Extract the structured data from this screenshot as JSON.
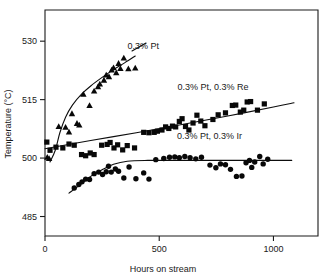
{
  "chart_data": {
    "type": "scatter",
    "title": "",
    "xlabel": "Hours on stream",
    "ylabel": "Temperature (°C)",
    "xlim": [
      0,
      1195
    ],
    "ylim": [
      480,
      538
    ],
    "grid": false,
    "legend_position": "inline-annotations",
    "xticks": [
      0,
      500,
      1000
    ],
    "xticklabels": [
      "0",
      "500",
      "1000"
    ],
    "yticks": [
      485,
      500,
      515,
      530
    ],
    "yticklabels": [
      "485",
      "500",
      "515",
      "530"
    ],
    "series": [
      {
        "name": "0.3% Pt",
        "marker": "triangle",
        "label": "0.3% Pt",
        "label_x": 430,
        "label_y": 528,
        "points": [
          [
            10,
            500.3
          ],
          [
            18,
            500.0
          ],
          [
            60,
            508.2
          ],
          [
            90,
            508.0
          ],
          [
            105,
            506.8
          ],
          [
            118,
            511.5
          ],
          [
            140,
            509.0
          ],
          [
            150,
            508.6
          ],
          [
            168,
            516.5
          ],
          [
            195,
            513.6
          ],
          [
            215,
            517.3
          ],
          [
            232,
            518.4
          ],
          [
            240,
            519.1
          ],
          [
            258,
            520.1
          ],
          [
            268,
            521.4
          ],
          [
            280,
            521.0
          ],
          [
            292,
            522.7
          ],
          [
            300,
            523.3
          ],
          [
            312,
            522.0
          ],
          [
            322,
            524.4
          ],
          [
            330,
            523.1
          ],
          [
            345,
            525.8
          ],
          [
            365,
            523.0
          ],
          [
            395,
            523.2
          ]
        ],
        "fit_curve": [
          [
            22,
            499.0
          ],
          [
            45,
            502.0
          ],
          [
            65,
            506.5
          ],
          [
            90,
            510.5
          ],
          [
            120,
            513.6
          ],
          [
            160,
            516.4
          ],
          [
            200,
            518.5
          ],
          [
            250,
            520.7
          ],
          [
            300,
            522.7
          ],
          [
            350,
            524.5
          ],
          [
            395,
            526.2
          ]
        ]
      },
      {
        "name": "0.3% Pt, 0.3% Re",
        "marker": "square",
        "label": "0.3% Pt, 0.3% Re",
        "label_x": 735,
        "label_y": 517.5,
        "points": [
          [
            8,
            504.1
          ],
          [
            22,
            502.0
          ],
          [
            48,
            502.8
          ],
          [
            78,
            502.6
          ],
          [
            105,
            503.6
          ],
          [
            128,
            503.3
          ],
          [
            160,
            500.9
          ],
          [
            178,
            500.6
          ],
          [
            198,
            501.3
          ],
          [
            215,
            500.9
          ],
          [
            248,
            503.3
          ],
          [
            272,
            503.5
          ],
          [
            285,
            504.0
          ],
          [
            302,
            502.6
          ],
          [
            318,
            503.4
          ],
          [
            340,
            502.1
          ],
          [
            360,
            503.2
          ],
          [
            392,
            502.6
          ],
          [
            432,
            506.6
          ],
          [
            455,
            506.5
          ],
          [
            478,
            506.6
          ],
          [
            492,
            506.9
          ],
          [
            512,
            507.2
          ],
          [
            528,
            508.0
          ],
          [
            542,
            507.6
          ],
          [
            558,
            508.2
          ],
          [
            572,
            508.0
          ],
          [
            588,
            509.4
          ],
          [
            600,
            510.1
          ],
          [
            615,
            508.1
          ],
          [
            630,
            507.2
          ],
          [
            648,
            509.0
          ],
          [
            665,
            511.0
          ],
          [
            682,
            509.5
          ],
          [
            700,
            508.3
          ],
          [
            735,
            509.9
          ],
          [
            758,
            511.1
          ],
          [
            790,
            511.6
          ],
          [
            820,
            513.5
          ],
          [
            835,
            513.6
          ],
          [
            855,
            511.8
          ],
          [
            870,
            512.3
          ],
          [
            885,
            514.4
          ],
          [
            900,
            514.5
          ],
          [
            930,
            512.3
          ],
          [
            960,
            513.9
          ]
        ],
        "fit_curve": [
          [
            0,
            502.4
          ],
          [
            200,
            504.5
          ],
          [
            400,
            506.5
          ],
          [
            600,
            508.6
          ],
          [
            800,
            510.8
          ],
          [
            1000,
            513.1
          ],
          [
            1090,
            514.2
          ]
        ]
      },
      {
        "name": "0.3% Pt, 0.3% Ir",
        "marker": "circle",
        "label": "0.3% Pt, 0.3% Ir",
        "label_x": 720,
        "label_y": 505.0,
        "points": [
          [
            128,
            492.3
          ],
          [
            148,
            493.2
          ],
          [
            162,
            493.9
          ],
          [
            178,
            494.6
          ],
          [
            195,
            494.5
          ],
          [
            215,
            496.0
          ],
          [
            235,
            496.4
          ],
          [
            252,
            495.8
          ],
          [
            268,
            496.5
          ],
          [
            278,
            497.9
          ],
          [
            290,
            496.4
          ],
          [
            308,
            497.2
          ],
          [
            322,
            496.6
          ],
          [
            345,
            494.9
          ],
          [
            368,
            497.7
          ],
          [
            398,
            494.7
          ],
          [
            432,
            496.2
          ],
          [
            455,
            494.6
          ],
          [
            485,
            499.6
          ],
          [
            520,
            499.9
          ],
          [
            545,
            500.2
          ],
          [
            568,
            500.3
          ],
          [
            588,
            500.1
          ],
          [
            612,
            500.4
          ],
          [
            635,
            500.1
          ],
          [
            660,
            499.8
          ],
          [
            685,
            500.2
          ],
          [
            722,
            498.2
          ],
          [
            748,
            497.5
          ],
          [
            768,
            498.5
          ],
          [
            790,
            498.3
          ],
          [
            812,
            497.1
          ],
          [
            838,
            495.3
          ],
          [
            862,
            495.4
          ],
          [
            880,
            498.8
          ],
          [
            895,
            499.4
          ],
          [
            905,
            497.6
          ],
          [
            918,
            499.0
          ],
          [
            940,
            500.4
          ],
          [
            955,
            498.5
          ],
          [
            975,
            499.7
          ]
        ],
        "fit_curve": [
          [
            105,
            491.0
          ],
          [
            150,
            493.0
          ],
          [
            200,
            495.3
          ],
          [
            250,
            497.0
          ],
          [
            300,
            498.4
          ],
          [
            360,
            499.2
          ],
          [
            450,
            499.4
          ],
          [
            600,
            499.4
          ],
          [
            800,
            499.4
          ],
          [
            1000,
            499.4
          ],
          [
            1080,
            499.4
          ]
        ]
      }
    ]
  }
}
